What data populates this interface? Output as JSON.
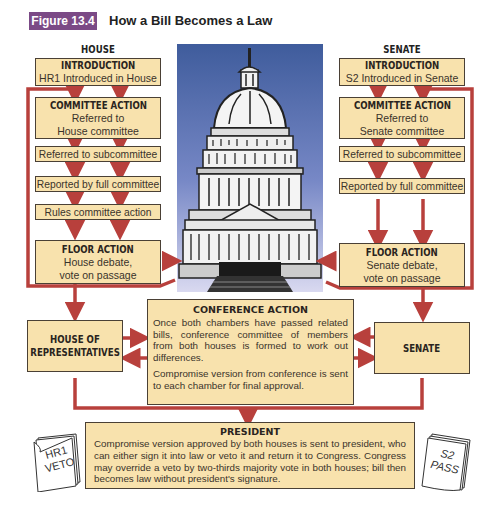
{
  "figure": {
    "badge": "Figure 13.4",
    "title": "How a Bill Becomes a Law"
  },
  "house": {
    "column_label": "HOUSE",
    "introduction": {
      "heading": "INTRODUCTION",
      "text": "HR1 Introduced in House"
    },
    "committee_action": {
      "heading": "COMMITTEE ACTION",
      "line1": "Referred to",
      "line2": "House committee"
    },
    "steps": [
      "Referred to subcommittee",
      "Reported by full committee",
      "Rules committee action"
    ],
    "floor_action": {
      "heading": "FLOOR ACTION",
      "line1": "House debate,",
      "line2": "vote on passage"
    },
    "chamber_box": {
      "line1": "HOUSE OF",
      "line2": "REPRESENTATIVES"
    }
  },
  "senate": {
    "column_label": "SENATE",
    "introduction": {
      "heading": "INTRODUCTION",
      "text": "S2 Introduced in Senate"
    },
    "committee_action": {
      "heading": "COMMITTEE ACTION",
      "line1": "Referred to",
      "line2": "Senate committee"
    },
    "steps": [
      "Referred to subcommittee",
      "Reported by full committee"
    ],
    "floor_action": {
      "heading": "FLOOR ACTION",
      "line1": "Senate debate,",
      "line2": "vote on passage"
    },
    "chamber_box": {
      "line1": "SENATE"
    }
  },
  "conference": {
    "heading": "CONFERENCE ACTION",
    "paragraph1": "Once both chambers have passed related bills, conference committee of members from both houses is formed to work out differences.",
    "paragraph2": "Compromise version from conference is sent to each chamber for final approval."
  },
  "president": {
    "heading": "PRESIDENT",
    "text": "Compromise version approved by both houses is sent to president, who can either sign it into law or veto it and return it to Congress. Congress may override a veto by two-thirds majority vote in both houses; bill then becomes law without president's signature."
  },
  "papers": {
    "left": {
      "line1": "HR1",
      "line2": "VETO"
    },
    "right": {
      "line1": "S2",
      "line2": "PASS"
    }
  },
  "colors": {
    "box_fill": "#f8e2ad",
    "arrow_red": "#b8403c",
    "badge_purple": "#7b4a86",
    "sky_top": "#3f5c9c",
    "sky_bottom": "#d9d9f0"
  }
}
